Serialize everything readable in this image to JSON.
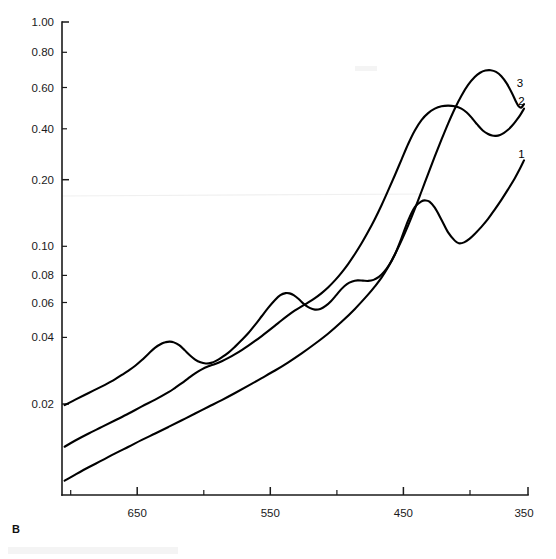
{
  "panel": {
    "label": "B"
  },
  "chart_data": {
    "type": "line",
    "title": "",
    "subtitle": "",
    "xlabel": "",
    "ylabel": "",
    "xscale": "linear-reversed",
    "yscale": "log",
    "xlim": [
      700,
      350
    ],
    "ylim": [
      0.01,
      1.0
    ],
    "grid": false,
    "legend_position": "curve-end-labels",
    "x_ticks_major": [
      650,
      550,
      450,
      350
    ],
    "x_tick_labels": [
      "650",
      "550",
      "450",
      "350"
    ],
    "x_ticks_minor": [
      700,
      600,
      500,
      400
    ],
    "y_ticks": [
      0.02,
      0.04,
      0.06,
      0.08,
      0.1,
      0.2,
      0.4,
      0.6,
      0.8,
      1.0
    ],
    "y_tick_labels": [
      "0.02",
      "0.04",
      "0.06",
      "0.08",
      "0.10",
      "0.20",
      "0.40",
      "0.60",
      "0.80",
      "1.00"
    ],
    "annotations": [
      {
        "text": "3",
        "x": 356,
        "y": 0.53
      },
      {
        "text": "2",
        "x": 355,
        "y": 0.445
      },
      {
        "text": "1",
        "x": 355,
        "y": 0.265
      }
    ],
    "series": [
      {
        "name": "1",
        "label": "1",
        "points": [
          [
            698,
            0.0115
          ],
          [
            690,
            0.0122
          ],
          [
            680,
            0.0131
          ],
          [
            670,
            0.014
          ],
          [
            660,
            0.015
          ],
          [
            650,
            0.016
          ],
          [
            640,
            0.0171
          ],
          [
            630,
            0.0182
          ],
          [
            620,
            0.0194
          ],
          [
            610,
            0.0207
          ],
          [
            600,
            0.0221
          ],
          [
            590,
            0.0236
          ],
          [
            580,
            0.0252
          ],
          [
            570,
            0.027
          ],
          [
            560,
            0.029
          ],
          [
            550,
            0.0312
          ],
          [
            540,
            0.0336
          ],
          [
            530,
            0.0364
          ],
          [
            520,
            0.0397
          ],
          [
            510,
            0.0436
          ],
          [
            500,
            0.0482
          ],
          [
            490,
            0.054
          ],
          [
            480,
            0.0612
          ],
          [
            470,
            0.0705
          ],
          [
            465,
            0.0762
          ],
          [
            460,
            0.083
          ],
          [
            455,
            0.092
          ],
          [
            450,
            0.104
          ],
          [
            445,
            0.122
          ],
          [
            440,
            0.145
          ],
          [
            435,
            0.165
          ],
          [
            430,
            0.1745
          ],
          [
            427,
            0.176
          ],
          [
            424,
            0.174
          ],
          [
            420,
            0.164
          ],
          [
            415,
            0.146
          ],
          [
            410,
            0.129
          ],
          [
            405,
            0.119
          ],
          [
            402,
            0.116
          ],
          [
            398,
            0.117
          ],
          [
            394,
            0.121
          ],
          [
            390,
            0.127
          ],
          [
            385,
            0.136
          ],
          [
            380,
            0.147
          ],
          [
            375,
            0.161
          ],
          [
            370,
            0.177
          ],
          [
            365,
            0.196
          ],
          [
            360,
            0.218
          ],
          [
            356,
            0.24
          ],
          [
            353,
            0.26
          ]
        ]
      },
      {
        "name": "2",
        "label": "2",
        "points": [
          [
            698,
            0.016
          ],
          [
            690,
            0.017
          ],
          [
            680,
            0.0182
          ],
          [
            670,
            0.0194
          ],
          [
            660,
            0.0207
          ],
          [
            650,
            0.0221
          ],
          [
            640,
            0.0237
          ],
          [
            630,
            0.0253
          ],
          [
            620,
            0.0272
          ],
          [
            615,
            0.0284
          ],
          [
            610,
            0.0297
          ],
          [
            605,
            0.0312
          ],
          [
            600,
            0.0327
          ],
          [
            595,
            0.034
          ],
          [
            590,
            0.035
          ],
          [
            585,
            0.0358
          ],
          [
            580,
            0.0368
          ],
          [
            575,
            0.038
          ],
          [
            570,
            0.0394
          ],
          [
            565,
            0.041
          ],
          [
            560,
            0.0428
          ],
          [
            555,
            0.0448
          ],
          [
            550,
            0.047
          ],
          [
            545,
            0.0494
          ],
          [
            540,
            0.052
          ],
          [
            535,
            0.0548
          ],
          [
            530,
            0.0576
          ],
          [
            525,
            0.0603
          ],
          [
            520,
            0.0628
          ],
          [
            515,
            0.0652
          ],
          [
            510,
            0.068
          ],
          [
            505,
            0.0714
          ],
          [
            500,
            0.0756
          ],
          [
            495,
            0.0808
          ],
          [
            490,
            0.0872
          ],
          [
            485,
            0.095
          ],
          [
            480,
            0.1045
          ],
          [
            475,
            0.116
          ],
          [
            470,
            0.13
          ],
          [
            465,
            0.147
          ],
          [
            460,
            0.168
          ],
          [
            455,
            0.194
          ],
          [
            450,
            0.225
          ],
          [
            445,
            0.262
          ],
          [
            440,
            0.305
          ],
          [
            435,
            0.348
          ],
          [
            430,
            0.385
          ],
          [
            425,
            0.412
          ],
          [
            420,
            0.43
          ],
          [
            415,
            0.44
          ],
          [
            410,
            0.443
          ],
          [
            405,
            0.44
          ],
          [
            400,
            0.43
          ],
          [
            396,
            0.414
          ],
          [
            392,
            0.392
          ],
          [
            388,
            0.368
          ],
          [
            384,
            0.348
          ],
          [
            380,
            0.336
          ],
          [
            377,
            0.331
          ],
          [
            374,
            0.33
          ],
          [
            371,
            0.333
          ],
          [
            368,
            0.34
          ],
          [
            365,
            0.35
          ],
          [
            362,
            0.364
          ],
          [
            359,
            0.382
          ],
          [
            356,
            0.403
          ],
          [
            353,
            0.43
          ]
        ]
      },
      {
        "name": "3",
        "label": "3",
        "points": [
          [
            698,
            0.024
          ],
          [
            690,
            0.0253
          ],
          [
            680,
            0.027
          ],
          [
            670,
            0.0288
          ],
          [
            665,
            0.0298
          ],
          [
            660,
            0.0309
          ],
          [
            655,
            0.0322
          ],
          [
            650,
            0.0336
          ],
          [
            645,
            0.0352
          ],
          [
            640,
            0.0372
          ],
          [
            635,
            0.0396
          ],
          [
            630,
            0.042
          ],
          [
            625,
            0.0437
          ],
          [
            622,
            0.0443
          ],
          [
            619,
            0.0445
          ],
          [
            616,
            0.0442
          ],
          [
            612,
            0.043
          ],
          [
            608,
            0.041
          ],
          [
            604,
            0.039
          ],
          [
            600,
            0.0374
          ],
          [
            596,
            0.0364
          ],
          [
            592,
            0.036
          ],
          [
            588,
            0.0362
          ],
          [
            584,
            0.037
          ],
          [
            580,
            0.0382
          ],
          [
            575,
            0.04
          ],
          [
            570,
            0.0424
          ],
          [
            565,
            0.0452
          ],
          [
            560,
            0.0484
          ],
          [
            555,
            0.0524
          ],
          [
            550,
            0.057
          ],
          [
            545,
            0.062
          ],
          [
            540,
            0.0668
          ],
          [
            536,
            0.07
          ],
          [
            532,
            0.0714
          ],
          [
            529,
            0.0712
          ],
          [
            526,
            0.07
          ],
          [
            522,
            0.0672
          ],
          [
            518,
            0.064
          ],
          [
            514,
            0.0618
          ],
          [
            510,
            0.0608
          ],
          [
            506,
            0.0612
          ],
          [
            502,
            0.063
          ],
          [
            498,
            0.066
          ],
          [
            494,
            0.07
          ],
          [
            490,
            0.0744
          ],
          [
            486,
            0.078
          ],
          [
            482,
            0.08
          ],
          [
            478,
            0.0808
          ],
          [
            474,
            0.0806
          ],
          [
            470,
            0.0804
          ],
          [
            466,
            0.0812
          ],
          [
            462,
            0.0836
          ],
          [
            458,
            0.088
          ],
          [
            454,
            0.0946
          ],
          [
            450,
            0.104
          ],
          [
            445,
            0.119
          ],
          [
            440,
            0.138
          ],
          [
            435,
            0.162
          ],
          [
            430,
            0.192
          ],
          [
            425,
            0.228
          ],
          [
            420,
            0.27
          ],
          [
            415,
            0.318
          ],
          [
            410,
            0.372
          ],
          [
            405,
            0.43
          ],
          [
            400,
            0.488
          ],
          [
            395,
            0.542
          ],
          [
            390,
            0.585
          ],
          [
            386,
            0.61
          ],
          [
            382,
            0.623
          ],
          [
            378,
            0.625
          ],
          [
            374,
            0.615
          ],
          [
            370,
            0.59
          ],
          [
            366,
            0.55
          ],
          [
            362,
            0.5
          ],
          [
            359,
            0.46
          ],
          [
            357,
            0.44
          ],
          [
            355,
            0.435
          ],
          [
            353,
            0.45
          ]
        ]
      }
    ]
  }
}
